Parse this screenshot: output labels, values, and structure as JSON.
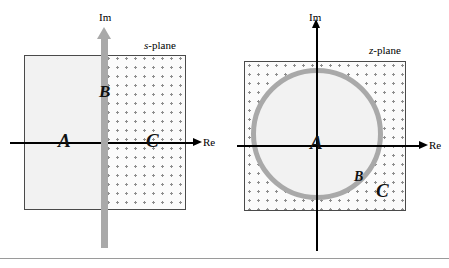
{
  "figure": {
    "background_color": "#ffffff",
    "divider_color": "#9a9a9a"
  },
  "colors": {
    "axis": "#000000",
    "jw_axis_gray": "#a9a9a9",
    "unit_circle_gray": "#a9a9a9",
    "box_border": "#4a4a4a",
    "shaded_fill": "#f2f2f2",
    "dotted_dot": "#8d8d8d"
  },
  "s_panel": {
    "plane_label_italic": "s",
    "plane_label_rest": "-plane",
    "im_axis_label": "Im",
    "re_axis_label": "Re",
    "regions": [
      {
        "letter": "A",
        "meaning": "left-half-plane-stable"
      },
      {
        "letter": "B",
        "meaning": "imaginary-axis-marginal"
      },
      {
        "letter": "C",
        "meaning": "right-half-plane-unstable"
      }
    ]
  },
  "z_panel": {
    "plane_label_italic": "z",
    "plane_label_rest": "-plane",
    "im_axis_label": "Im",
    "re_axis_label": "Re",
    "regions": [
      {
        "letter": "A",
        "meaning": "inside-unit-circle-stable"
      },
      {
        "letter": "B",
        "meaning": "on-unit-circle-marginal"
      },
      {
        "letter": "C",
        "meaning": "outside-unit-circle-unstable"
      }
    ]
  }
}
